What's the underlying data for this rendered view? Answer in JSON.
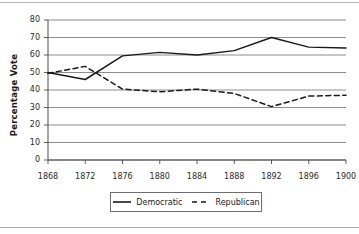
{
  "chart_data": {
    "type": "line",
    "title": "",
    "xlabel": "",
    "ylabel": "Percentage Vote",
    "x": [
      1868,
      1872,
      1876,
      1880,
      1884,
      1888,
      1892,
      1896,
      1900
    ],
    "categories": [
      "1868",
      "1872",
      "1876",
      "1880",
      "1884",
      "1888",
      "1892",
      "1896",
      "1900"
    ],
    "xlim": [
      1868,
      1900
    ],
    "ylim": [
      0,
      80
    ],
    "yticks": [
      0,
      10,
      20,
      30,
      40,
      50,
      60,
      70,
      80
    ],
    "ytick_labels": [
      "0",
      "10",
      "20",
      "30",
      "40",
      "50",
      "60",
      "70",
      "80"
    ],
    "grid": "horizontal",
    "legend_position": "bottom",
    "series": [
      {
        "name": "Democratic",
        "style": "solid",
        "color": "#1a1a1a",
        "values": [
          50,
          46,
          59.5,
          61.5,
          60,
          62.5,
          70,
          64.5,
          64
        ]
      },
      {
        "name": "Republican",
        "style": "dashed",
        "color": "#1a1a1a",
        "values": [
          49.5,
          53.5,
          40.5,
          39,
          40.5,
          38,
          30.5,
          36.5,
          37
        ]
      }
    ]
  },
  "legend": {
    "items": [
      {
        "label": "Democratic"
      },
      {
        "label": "Republican"
      }
    ]
  },
  "colors": {
    "gridline": "#808080",
    "axis": "#4d4d4d",
    "series": "#1a1a1a",
    "background": "#ffffff"
  }
}
